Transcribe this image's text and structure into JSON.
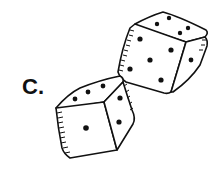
{
  "figure": {
    "label": "C.",
    "dice": [
      {
        "name": "upper-die",
        "faces": {
          "top": 4,
          "front": 5,
          "right": 1
        }
      },
      {
        "name": "lower-die",
        "faces": {
          "top": 3,
          "front": 1,
          "right": 2
        }
      }
    ],
    "colors": {
      "ink": "#111111",
      "background": "#ffffff"
    }
  }
}
